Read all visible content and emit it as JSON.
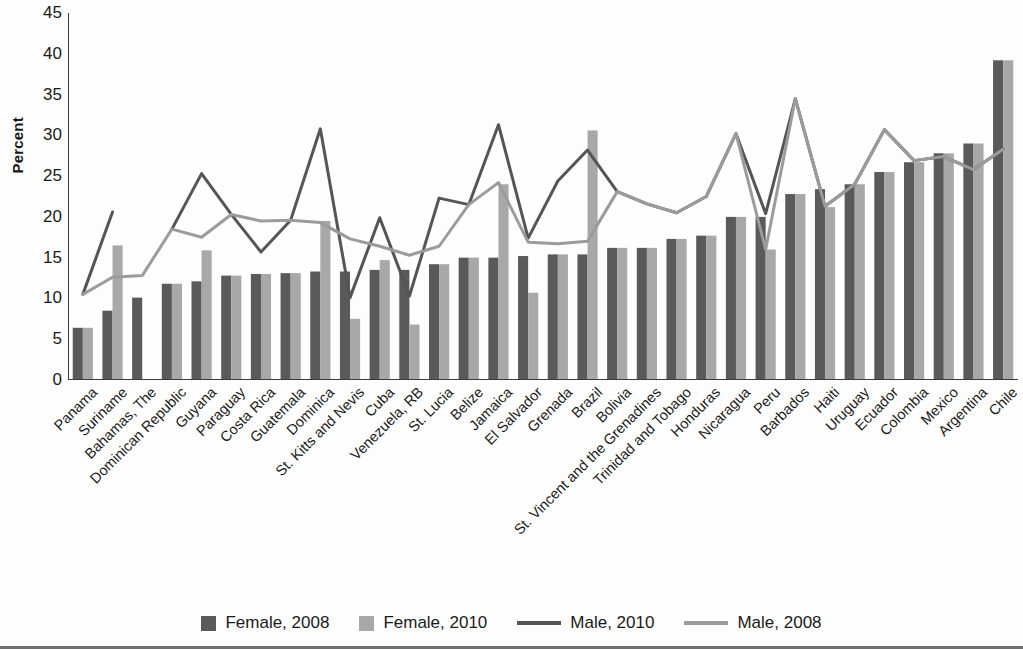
{
  "chart_data": {
    "type": "bar",
    "title": "",
    "xlabel": "",
    "ylabel": "Percent",
    "ylim": [
      0,
      45
    ],
    "yticks": [
      0,
      5,
      10,
      15,
      20,
      25,
      30,
      35,
      40,
      45
    ],
    "grid": false,
    "legend_position": "bottom",
    "categories": [
      "Panama",
      "Suriname",
      "Bahamas, The",
      "Dominican Republic",
      "Guyana",
      "Paraguay",
      "Costa Rica",
      "Guatemala",
      "Dominica",
      "St. Kitts and Nevis",
      "Cuba",
      "Venezuela, RB",
      "St. Lucia",
      "Belize",
      "Jamaica",
      "El Salvador",
      "Grenada",
      "Brazil",
      "Bolivia",
      "St. Vincent and the Grenadines",
      "Trinidad and Tobago",
      "Honduras",
      "Nicaragua",
      "Peru",
      "Barbados",
      "Haiti",
      "Uruguay",
      "Ecuador",
      "Colombia",
      "Mexico",
      "Argentina",
      "Chile"
    ],
    "series": [
      {
        "name": "Female, 2008",
        "kind": "bar",
        "color": "#5a5a5a",
        "values": [
          6.4,
          8.5,
          10.1,
          11.8,
          12.1,
          12.8,
          13.0,
          13.1,
          13.3,
          13.3,
          13.5,
          13.5,
          14.2,
          15.0,
          15.0,
          15.2,
          15.4,
          15.4,
          16.2,
          16.2,
          17.3,
          17.7,
          20.0,
          20.0,
          22.8,
          23.4,
          24.0,
          25.5,
          26.7,
          27.8,
          29.0,
          39.2
        ]
      },
      {
        "name": "Female, 2010",
        "kind": "bar",
        "color": "#a8a8a8",
        "values": [
          6.4,
          16.5,
          null,
          11.8,
          15.9,
          12.8,
          13.0,
          13.1,
          19.5,
          7.5,
          14.7,
          6.8,
          14.2,
          15.0,
          24.0,
          10.7,
          15.4,
          30.6,
          16.2,
          16.2,
          17.3,
          17.7,
          20.0,
          16.0,
          22.8,
          21.2,
          24.0,
          25.5,
          26.7,
          27.8,
          29.0,
          39.2
        ]
      },
      {
        "name": "Male, 2010",
        "kind": "line",
        "color": "#555555",
        "values": [
          10.5,
          20.6,
          null,
          18.5,
          25.3,
          20.3,
          15.7,
          19.6,
          30.8,
          10.1,
          19.9,
          10.3,
          22.3,
          21.5,
          31.3,
          17.4,
          24.4,
          28.2,
          23.1,
          21.6,
          20.5,
          22.5,
          30.2,
          20.4,
          34.5,
          21.3,
          24.0,
          30.7,
          26.9,
          27.4,
          25.8,
          28.3
        ]
      },
      {
        "name": "Male, 2008",
        "kind": "line",
        "color": "#9b9b9b",
        "values": [
          10.5,
          12.6,
          12.8,
          18.5,
          17.5,
          20.3,
          19.5,
          19.6,
          19.3,
          17.3,
          16.4,
          15.3,
          16.4,
          21.5,
          24.2,
          16.9,
          16.7,
          17.0,
          23.1,
          21.6,
          20.5,
          22.5,
          30.2,
          16.0,
          34.5,
          21.3,
          24.0,
          30.7,
          26.9,
          27.4,
          25.8,
          28.3
        ]
      }
    ],
    "legend": [
      {
        "label": "Female, 2008",
        "marker": "square",
        "color": "#5a5a5a"
      },
      {
        "label": "Female, 2010",
        "marker": "square",
        "color": "#a8a8a8"
      },
      {
        "label": "Male, 2010",
        "marker": "line",
        "color": "#555555"
      },
      {
        "label": "Male, 2008",
        "marker": "line",
        "color": "#9b9b9b"
      }
    ]
  },
  "axis": {
    "color": "#3b3b3b"
  }
}
